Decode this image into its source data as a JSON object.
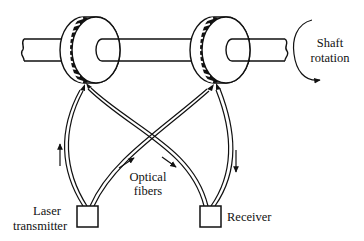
{
  "diagram": {
    "type": "optical shaft encoder schematic",
    "labels": {
      "shaft_rotation_line1": "Shaft",
      "shaft_rotation_line2": "rotation",
      "optical_fibers_line1": "Optical",
      "optical_fibers_line2": "fibers",
      "laser_line1": "Laser",
      "laser_line2": "transmitter",
      "receiver": "Receiver"
    },
    "components": [
      {
        "name": "shaft",
        "icon": "shaft-cylinder"
      },
      {
        "name": "left-encoder-disc",
        "icon": "slotted-disc"
      },
      {
        "name": "right-encoder-disc",
        "icon": "slotted-disc"
      },
      {
        "name": "laser-transmitter",
        "icon": "box"
      },
      {
        "name": "receiver",
        "icon": "box"
      },
      {
        "name": "optical-fibers",
        "count": 4
      }
    ],
    "colors": {
      "line": "#111111",
      "background": "#ffffff"
    }
  }
}
